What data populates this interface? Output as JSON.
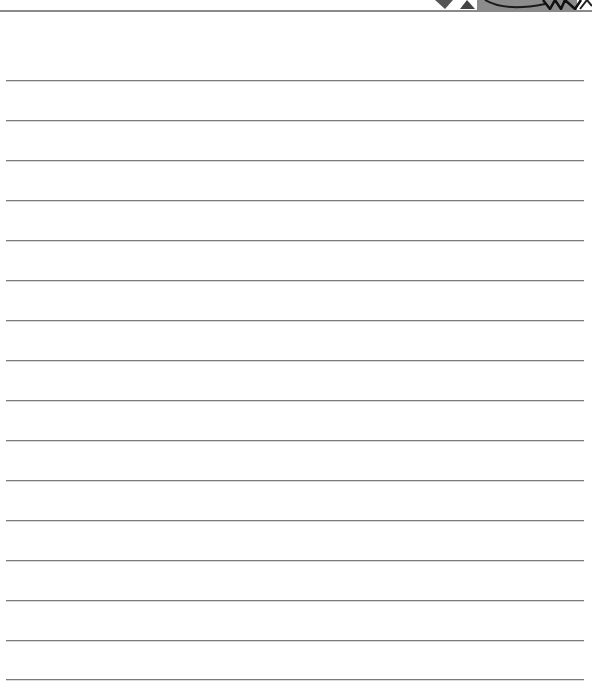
{
  "page": {
    "type": "lined-writing-sheet",
    "line_count": 16,
    "line_color": "#7a7a7a",
    "border_color": "#8a8a8a",
    "illustration": {
      "icon": "cartoon-illustration-fragment",
      "fill": "#8c8c8c",
      "stroke": "#1a1a1a"
    }
  }
}
